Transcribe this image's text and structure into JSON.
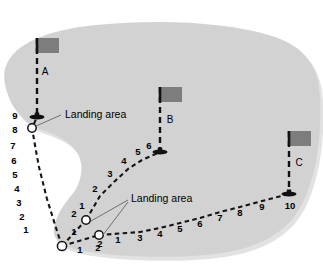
{
  "figure": {
    "type": "diagram",
    "title": "",
    "background_color": "#ffffff",
    "land_color": "#d2d2d2",
    "land_shadow_color": "#e2e2e2",
    "flag_color": "#7d7d7d",
    "pole_color": "#111111",
    "path_color": "#141414",
    "marker_fill": "#ffffff",
    "marker_stroke": "#111111",
    "callout_line_color": "#6e6e6e"
  },
  "flags": [
    {
      "id": "flag-a",
      "label": "A",
      "pole_x": 37,
      "pole_top": 38,
      "pole_bottom": 117,
      "banner_x": 37,
      "banner_y": 38,
      "banner_w": 22,
      "banner_h": 15,
      "label_x": 45,
      "label_y": 72
    },
    {
      "id": "flag-b",
      "label": "B",
      "pole_x": 160,
      "pole_top": 87,
      "pole_bottom": 152,
      "banner_x": 160,
      "banner_y": 87,
      "banner_w": 22,
      "banner_h": 15,
      "label_x": 170,
      "label_y": 120
    },
    {
      "id": "flag-c",
      "label": "C",
      "pole_x": 289,
      "pole_top": 131,
      "pole_bottom": 194,
      "banner_x": 289,
      "banner_y": 131,
      "banner_w": 22,
      "banner_h": 15,
      "label_x": 299,
      "label_y": 163
    }
  ],
  "landing_areas": [
    {
      "id": "landing-marker-upper-left",
      "cx": 32,
      "cy": 128,
      "r": 4.2
    },
    {
      "id": "landing-marker-middle",
      "cx": 86,
      "cy": 220,
      "r": 4.2
    },
    {
      "id": "landing-marker-lower",
      "cx": 99,
      "cy": 235,
      "r": 4.2
    },
    {
      "id": "landing-marker-origin",
      "cx": 62,
      "cy": 246,
      "r": 4.6
    }
  ],
  "callouts": [
    {
      "id": "callout-upper",
      "text": "Landing area",
      "text_x": 65,
      "text_y": 115,
      "leader": [
        [
          61,
          115
        ],
        [
          36,
          126
        ]
      ]
    },
    {
      "id": "callout-lower",
      "text": "Landing area",
      "text_x": 131,
      "text_y": 199,
      "leader_a": [
        [
          128,
          200
        ],
        [
          91,
          221
        ]
      ],
      "leader_b": [
        [
          128,
          202
        ],
        [
          103,
          235
        ]
      ]
    }
  ],
  "paths": [
    {
      "id": "path-to-flag-a",
      "from": "landing-marker-origin",
      "to": "flag-a",
      "point_count": 9,
      "labels": [
        "1",
        "2",
        "3",
        "4",
        "5",
        "6",
        "7",
        "8",
        "9"
      ],
      "nodes": [
        {
          "n": "1",
          "x": 62,
          "y": 246,
          "lx": 26,
          "ly": 230
        },
        {
          "n": "2",
          "x": 57,
          "y": 231,
          "lx": 22,
          "ly": 217
        },
        {
          "n": "3",
          "x": 52,
          "y": 215,
          "lx": 19,
          "ly": 203
        },
        {
          "n": "4",
          "x": 47,
          "y": 199,
          "lx": 17,
          "ly": 189
        },
        {
          "n": "5",
          "x": 43,
          "y": 183,
          "lx": 15,
          "ly": 175
        },
        {
          "n": "6",
          "x": 39,
          "y": 167,
          "lx": 14,
          "ly": 161
        },
        {
          "n": "7",
          "x": 36,
          "y": 151,
          "lx": 13,
          "ly": 146
        },
        {
          "n": "8",
          "x": 32,
          "y": 128,
          "lx": 15,
          "ly": 130
        },
        {
          "n": "9",
          "x": 37,
          "y": 117,
          "lx": 15,
          "ly": 116
        }
      ]
    },
    {
      "id": "path-to-flag-b",
      "from": "landing-marker-middle",
      "to": "flag-b",
      "point_count": 6,
      "labels": [
        "1",
        "2",
        "3",
        "4",
        "5",
        "6"
      ],
      "nodes": [
        {
          "n": "1",
          "x": 86,
          "y": 220,
          "lx": 82,
          "ly": 206
        },
        {
          "n": "2",
          "x": 100,
          "y": 196,
          "lx": 95,
          "ly": 189
        },
        {
          "n": "3",
          "x": 114,
          "y": 182,
          "lx": 110,
          "ly": 174
        },
        {
          "n": "4",
          "x": 128,
          "y": 169,
          "lx": 124,
          "ly": 161
        },
        {
          "n": "5",
          "x": 142,
          "y": 160,
          "lx": 138,
          "ly": 152
        },
        {
          "n": "6",
          "x": 160,
          "y": 152,
          "lx": 149,
          "ly": 146
        }
      ]
    },
    {
      "id": "path-to-flag-c",
      "from": "landing-marker-lower",
      "to": "flag-c",
      "point_count": 10,
      "labels": [
        "1",
        "2",
        "3",
        "4",
        "5",
        "6",
        "7",
        "8",
        "9",
        "10"
      ],
      "nodes": [
        {
          "n": "1",
          "x": 99,
          "y": 235,
          "lx": 118,
          "ly": 240
        },
        {
          "n": "2",
          "x": 99,
          "y": 235,
          "lx": 100,
          "ly": 244
        },
        {
          "n": "3",
          "x": 140,
          "y": 232,
          "lx": 140,
          "ly": 238
        },
        {
          "n": "4",
          "x": 160,
          "y": 228,
          "lx": 160,
          "ly": 234
        },
        {
          "n": "5",
          "x": 180,
          "y": 223,
          "lx": 180,
          "ly": 229
        },
        {
          "n": "6",
          "x": 200,
          "y": 218,
          "lx": 200,
          "ly": 224
        },
        {
          "n": "7",
          "x": 220,
          "y": 212,
          "lx": 220,
          "ly": 218
        },
        {
          "n": "8",
          "x": 240,
          "y": 207,
          "lx": 240,
          "ly": 213
        },
        {
          "n": "9",
          "x": 262,
          "y": 201,
          "lx": 262,
          "ly": 207
        },
        {
          "n": "10",
          "x": 289,
          "y": 194,
          "lx": 290,
          "ly": 206
        }
      ]
    },
    {
      "id": "path-origin-to-middle",
      "from": "landing-marker-origin",
      "to": "landing-marker-middle",
      "label": "1",
      "label_x": 74,
      "label_y": 232
    },
    {
      "id": "path-origin-to-lower",
      "from": "landing-marker-origin",
      "to": "landing-marker-lower",
      "label": "1",
      "label_x": 80,
      "label_y": 250
    },
    {
      "id": "label-middle-node-2",
      "label": "2",
      "label_x": 74,
      "label_y": 214
    },
    {
      "id": "label-lower-node-2",
      "label": "2",
      "label_x": 98,
      "label_y": 248
    }
  ],
  "land_outline_path": "M 6 66 C 14 44 46 30 96 25 C 160 19 226 22 272 36 C 304 46 319 66 320 98 C 322 134 317 178 300 208 C 284 236 252 251 206 255 C 160 259 108 256 78 250 C 60 246 52 238 54 228 C 56 214 66 202 74 192 C 82 180 84 166 78 154 C 70 140 54 134 42 130 C 26 124 12 110 7 92 C 4 82 3 73 6 66 Z",
  "land_shadow_path": "M 10 70 C 18 48 50 34 100 29 C 164 23 230 26 276 40 C 308 50 322 70 323 102 C 325 138 320 182 303 212 C 287 240 255 255 209 259 C 163 263 111 260 81 254 C 63 250 55 242 57 232 C 59 218 69 206 77 196 C 85 184 87 170 81 158 C 73 144 57 138 45 134 C 29 128 15 114 10 96 C 7 86 7 77 10 70 Z"
}
